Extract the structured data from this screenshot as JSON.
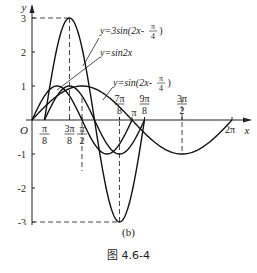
{
  "chart_data": {
    "type": "line",
    "title": "",
    "xlabel": "x",
    "ylabel": "y",
    "origin_label": "O",
    "xlim": [
      0,
      6.6
    ],
    "ylim": [
      -3.2,
      3.3
    ],
    "grid": false,
    "y_ticks": [
      {
        "value": 3,
        "label": "3"
      },
      {
        "value": 2,
        "label": "2"
      },
      {
        "value": 1,
        "label": "1"
      },
      {
        "value": -1,
        "label": "-1"
      },
      {
        "value": -2,
        "label": "-2"
      },
      {
        "value": -3,
        "label": "-3"
      }
    ],
    "x_ticks": [
      {
        "value": 0.3927,
        "num": "π",
        "den": "8"
      },
      {
        "value": 1.1781,
        "num": "3π",
        "den": "8"
      },
      {
        "value": 1.5708,
        "num": "π",
        "den": "2"
      },
      {
        "value": 2.7489,
        "num": "7π",
        "den": "8"
      },
      {
        "value": 3.1416,
        "label": "π"
      },
      {
        "value": 3.5343,
        "num": "9π",
        "den": "8"
      },
      {
        "value": 4.7124,
        "num": "3π",
        "den": "2"
      },
      {
        "value": 6.2832,
        "label": "2π"
      }
    ],
    "series": [
      {
        "name": "y=3sin(2x-π/4)",
        "amplitude": 3,
        "omega": 2,
        "phase": -0.7854,
        "domain": [
          0.3927,
          3.5343
        ]
      },
      {
        "name": "y=sin2x",
        "amplitude": 1,
        "omega": 2,
        "phase": 0,
        "domain": [
          0,
          3.1416
        ]
      },
      {
        "name": "y=sin(2x-π/4)",
        "amplitude": 1,
        "omega": 1,
        "phase": 0,
        "domain": [
          0,
          6.2832
        ]
      }
    ],
    "annotations": [
      {
        "text": "y=3sin(2x-",
        "frac_num": "π",
        "frac_den": "4",
        "close": ")"
      },
      {
        "text": "y=sin2x"
      },
      {
        "text": "y=sin(2x-",
        "frac_num": "π",
        "frac_den": "4",
        "close": ")"
      }
    ],
    "dashed_guides": [
      {
        "type": "max",
        "x": 1.1781,
        "y": 3
      },
      {
        "type": "min",
        "x": 2.7489,
        "y": -3
      },
      {
        "type": "vline",
        "x": 1.5708
      },
      {
        "type": "vline",
        "x": 4.7124
      }
    ]
  },
  "captions": {
    "sub": "(b)",
    "figure": "图 4.6-4"
  }
}
